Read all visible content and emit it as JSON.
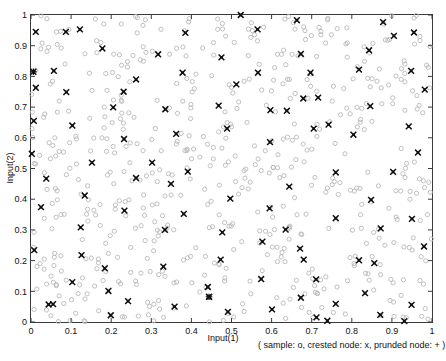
{
  "figure": {
    "background_color": "#ffffff",
    "frame_color": "#3a3a3a"
  },
  "axis": {
    "x_title": "Input(1)",
    "y_title": "Input(2)",
    "x_ticks": [
      "0",
      "0.1",
      "0.2",
      "0.3",
      "0.4",
      "0.5",
      "0.6",
      "0.7",
      "0.8",
      "0.9",
      "1"
    ],
    "y_ticks": [
      "0",
      "0.1",
      "0.2",
      "0.3",
      "0.4",
      "0.5",
      "0.6",
      "0.7",
      "0.8",
      "0.9",
      "1"
    ]
  },
  "legend": {
    "caption": "( sample: o,  crested node: x,  prunded node: + )"
  },
  "chart_data": {
    "type": "scatter",
    "title": "",
    "xlabel": "Input(1)",
    "ylabel": "Input(2)",
    "xlim": [
      0,
      1
    ],
    "ylim": [
      0,
      1
    ],
    "xticks": [
      0,
      0.1,
      0.2,
      0.3,
      0.4,
      0.5,
      0.6,
      0.7,
      0.8,
      0.9,
      1
    ],
    "yticks": [
      0,
      0.1,
      0.2,
      0.3,
      0.4,
      0.5,
      0.6,
      0.7,
      0.8,
      0.9,
      1
    ],
    "grid": false,
    "legend_position": "below-right",
    "legend_text": "( sample: o,  crested node: x,  prunded node: + )",
    "series": [
      {
        "name": "sample",
        "marker": "o",
        "color": "#b9b9b9",
        "count": 620,
        "distribution": "uniform-random over unit square",
        "note": "small open circles filling the whole [0,1]x[0,1] domain"
      },
      {
        "name": "crested node",
        "marker": "x",
        "color": "#101010",
        "count": 104,
        "points": [
          [
            0.012,
            0.945
          ],
          [
            0.087,
            0.945
          ],
          [
            0.385,
            0.942
          ],
          [
            0.523,
            1.0
          ],
          [
            0.565,
            0.953
          ],
          [
            0.663,
            0.983
          ],
          [
            0.878,
            0.977
          ],
          [
            0.905,
            0.932
          ],
          [
            0.955,
            0.943
          ],
          [
            0.178,
            0.891
          ],
          [
            0.317,
            0.872
          ],
          [
            0.475,
            0.862
          ],
          [
            0.673,
            0.873
          ],
          [
            0.843,
            0.885
          ],
          [
            0.006,
            0.815
          ],
          [
            0.057,
            0.818
          ],
          [
            0.378,
            0.812
          ],
          [
            0.697,
            0.812
          ],
          [
            0.818,
            0.822
          ],
          [
            0.948,
            0.818
          ],
          [
            0.012,
            0.763
          ],
          [
            0.262,
            0.79
          ],
          [
            0.512,
            0.774
          ],
          [
            0.982,
            0.757
          ],
          [
            0.088,
            0.749
          ],
          [
            0.597,
            0.69
          ],
          [
            0.205,
            0.699
          ],
          [
            0.335,
            0.693
          ],
          [
            0.468,
            0.705
          ],
          [
            0.679,
            0.728
          ],
          [
            0.716,
            0.731
          ],
          [
            0.846,
            0.703
          ],
          [
            0.007,
            0.655
          ],
          [
            0.103,
            0.64
          ],
          [
            0.489,
            0.63
          ],
          [
            0.742,
            0.643
          ],
          [
            0.942,
            0.637
          ],
          [
            0.232,
            0.596
          ],
          [
            0.362,
            0.613
          ],
          [
            0.804,
            0.61
          ],
          [
            0.002,
            0.548
          ],
          [
            0.596,
            0.586
          ],
          [
            0.965,
            0.552
          ],
          [
            0.152,
            0.519
          ],
          [
            0.391,
            0.49
          ],
          [
            0.76,
            0.487
          ],
          [
            0.903,
            0.489
          ],
          [
            0.038,
            0.467
          ],
          [
            0.262,
            0.469
          ],
          [
            0.349,
            0.45
          ],
          [
            0.644,
            0.441
          ],
          [
            0.134,
            0.412
          ],
          [
            0.497,
            0.402
          ],
          [
            0.848,
            0.398
          ],
          [
            0.025,
            0.374
          ],
          [
            0.233,
            0.363
          ],
          [
            0.381,
            0.352
          ],
          [
            0.595,
            0.37
          ],
          [
            0.76,
            0.338
          ],
          [
            0.95,
            0.336
          ],
          [
            0.124,
            0.308
          ],
          [
            0.334,
            0.3
          ],
          [
            0.477,
            0.292
          ],
          [
            0.635,
            0.301
          ],
          [
            0.872,
            0.305
          ],
          [
            0.577,
            0.262
          ],
          [
            0.008,
            0.234
          ],
          [
            0.671,
            0.239
          ],
          [
            0.126,
            0.218
          ],
          [
            0.473,
            0.203
          ],
          [
            0.68,
            0.203
          ],
          [
            0.818,
            0.201
          ],
          [
            0.184,
            0.175
          ],
          [
            0.33,
            0.18
          ],
          [
            0.856,
            0.192
          ],
          [
            0.574,
            0.14
          ],
          [
            0.711,
            0.139
          ],
          [
            0.103,
            0.13
          ],
          [
            0.441,
            0.114
          ],
          [
            0.193,
            0.101
          ],
          [
            0.833,
            0.094
          ],
          [
            0.044,
            0.057
          ],
          [
            0.055,
            0.058
          ],
          [
            0.242,
            0.068
          ],
          [
            0.358,
            0.05
          ],
          [
            0.444,
            0.082
          ],
          [
            0.673,
            0.079
          ],
          [
            0.76,
            0.059
          ],
          [
            0.949,
            0.056
          ],
          [
            0.199,
            0.022
          ],
          [
            0.491,
            0.033
          ],
          [
            0.601,
            0.041
          ],
          [
            0.712,
            0.015
          ],
          [
            0.739,
            0.004
          ],
          [
            0.871,
            0.023
          ],
          [
            0.931,
            0.003
          ],
          [
            0.98,
            0.246
          ],
          [
            0.302,
            0.519
          ],
          [
            0.566,
            0.812
          ],
          [
            0.705,
            0.63
          ],
          [
            0.444,
            0.082
          ],
          [
            0.122,
            0.953
          ],
          [
            0.231,
            0.75
          ],
          [
            0.638,
            0.688
          ]
        ]
      },
      {
        "name": "prunded node",
        "marker": "+",
        "color": "#101010",
        "count": 2,
        "points": [
          [
            0.444,
            0.082
          ],
          [
            0.006,
            0.815
          ]
        ]
      }
    ]
  }
}
